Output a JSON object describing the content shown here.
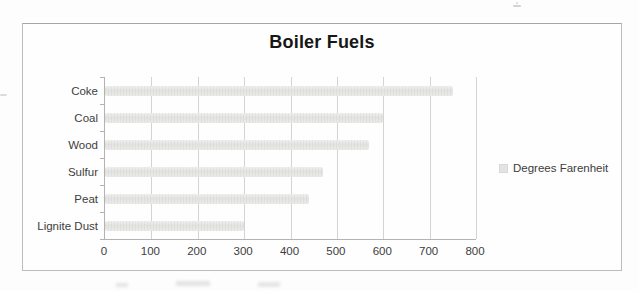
{
  "page": {
    "background_color": "#fdfdfd"
  },
  "chart": {
    "border_color": "#bcbcbc",
    "background_color": "#fefefe",
    "bar_color": "#e5e5e4",
    "gridline_color": "#d4d4d4",
    "axis_color": "#b3b3b3",
    "title_color": "#171717",
    "label_color": "#3d3d3d",
    "legend": {
      "label": "Degrees Farenheit",
      "marker_color": "#e3e3e3"
    }
  },
  "chart_data": {
    "type": "bar",
    "orientation": "horizontal",
    "title": "Boiler Fuels",
    "categories": [
      "Coke",
      "Coal",
      "Wood",
      "Sulfur",
      "Peat",
      "Lignite Dust"
    ],
    "values": [
      750,
      600,
      570,
      470,
      440,
      300
    ],
    "series": [
      {
        "name": "Degrees Farenheit",
        "values": [
          750,
          600,
          570,
          470,
          440,
          300
        ]
      }
    ],
    "xlabel": "",
    "ylabel": "",
    "xlim": [
      0,
      800
    ],
    "x_ticks": [
      0,
      100,
      200,
      300,
      400,
      500,
      600,
      700,
      800
    ],
    "grid": true,
    "legend_position": "right"
  }
}
